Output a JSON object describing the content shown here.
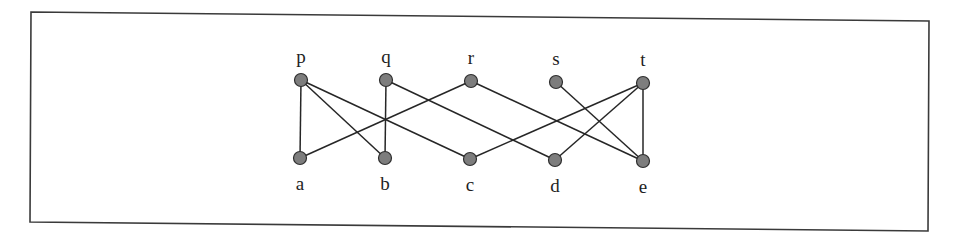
{
  "diagram": {
    "type": "bipartite-graph",
    "colors": {
      "node_fill": "#7d7d7d",
      "node_stroke": "#2e2e2e",
      "edge": "#262626",
      "frame": "#3a3a3a"
    },
    "top_nodes": [
      {
        "id": "p",
        "label": "p",
        "x": 301,
        "y": 80
      },
      {
        "id": "q",
        "label": "q",
        "x": 386,
        "y": 80
      },
      {
        "id": "r",
        "label": "r",
        "x": 471,
        "y": 81
      },
      {
        "id": "s",
        "label": "s",
        "x": 556,
        "y": 82
      },
      {
        "id": "t",
        "label": "t",
        "x": 643,
        "y": 83
      }
    ],
    "bottom_nodes": [
      {
        "id": "a",
        "label": "a",
        "x": 300,
        "y": 158
      },
      {
        "id": "b",
        "label": "b",
        "x": 385,
        "y": 158
      },
      {
        "id": "c",
        "label": "c",
        "x": 470,
        "y": 159
      },
      {
        "id": "d",
        "label": "d",
        "x": 555,
        "y": 160
      },
      {
        "id": "e",
        "label": "e",
        "x": 643,
        "y": 161
      }
    ],
    "edges": [
      [
        "p",
        "a"
      ],
      [
        "p",
        "b"
      ],
      [
        "p",
        "c"
      ],
      [
        "q",
        "b"
      ],
      [
        "q",
        "d"
      ],
      [
        "r",
        "a"
      ],
      [
        "r",
        "e"
      ],
      [
        "s",
        "e"
      ],
      [
        "t",
        "c"
      ],
      [
        "t",
        "d"
      ],
      [
        "t",
        "e"
      ]
    ]
  }
}
